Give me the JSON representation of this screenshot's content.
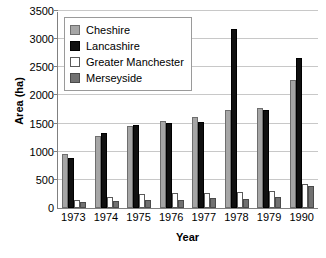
{
  "chart_data": {
    "type": "bar",
    "title": "",
    "xlabel": "Year",
    "ylabel": "Area (ha)",
    "categories": [
      "1973",
      "1974",
      "1975",
      "1976",
      "1977",
      "1978",
      "1979",
      "1990"
    ],
    "series": [
      {
        "name": "Cheshire",
        "color": "#a6a6a6",
        "values": [
          955,
          1275,
          1450,
          1540,
          1620,
          1750,
          1770,
          2280
        ]
      },
      {
        "name": "Lancashire",
        "color": "#101010",
        "values": [
          890,
          1340,
          1480,
          1505,
          1525,
          3180,
          1750,
          2670
        ]
      },
      {
        "name": "Greater Manchester",
        "color": "#ffffff",
        "values": [
          140,
          195,
          255,
          270,
          275,
          285,
          310,
          425
        ]
      },
      {
        "name": "Merseyside",
        "color": "#717171",
        "values": [
          115,
          120,
          145,
          145,
          170,
          155,
          190,
          390
        ]
      }
    ],
    "ylim": [
      0,
      3500
    ],
    "yticks": [
      0,
      500,
      1000,
      1500,
      2000,
      2500,
      3000,
      3500
    ],
    "ytick_labels": [
      "0",
      "500",
      "1000",
      "1500",
      "2000",
      "2500",
      "3000",
      "3500"
    ],
    "grid": true,
    "legend_position": "upper left",
    "legend_entries": [
      "Cheshire",
      "Lancashire",
      "Greater Manchester",
      "Merseyside"
    ]
  }
}
